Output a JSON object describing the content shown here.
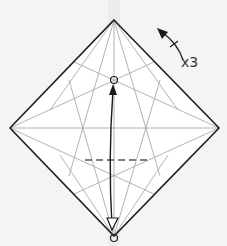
{
  "diagram": {
    "type": "origami-step",
    "repeat_label": "x3",
    "colors": {
      "paper": "#ffffff",
      "background": "#f3f3f3",
      "edge": "#222222",
      "crease": "#9a9a9a",
      "arrow": "#1a1a1a",
      "valley": "#555555"
    }
  }
}
